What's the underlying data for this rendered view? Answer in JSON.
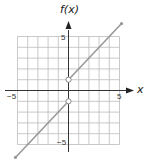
{
  "chart_data": {
    "type": "line",
    "title": "",
    "xlabel": "x",
    "ylabel": "f(x)",
    "xlim": [
      -5,
      5
    ],
    "ylim": [
      -5,
      5
    ],
    "grid": true,
    "grid_step": 1,
    "x_tick_labels": [
      "-5",
      "5"
    ],
    "y_tick_labels": [
      "5",
      "-5"
    ],
    "series": [
      {
        "name": "left piece",
        "equation": "f(x) = x - 1",
        "domain": "x < 0",
        "x": [
          -5.2,
          0
        ],
        "y": [
          -6.2,
          -1
        ],
        "endpoint": {
          "x": 0,
          "y": -1,
          "type": "open"
        }
      },
      {
        "name": "right piece",
        "equation": "f(x) = x + 1",
        "domain": "x > 0",
        "x": [
          0,
          5.2
        ],
        "y": [
          1,
          6.2
        ],
        "endpoint": {
          "x": 0,
          "y": 1,
          "type": "open"
        }
      }
    ],
    "colors": {
      "line": "#999999",
      "grid": "#bbbbbb",
      "axis": "#333333"
    }
  },
  "labels": {
    "y_axis": "f(x)",
    "x_axis": "x",
    "x_min": "−5",
    "x_max": "5",
    "y_max": "5",
    "y_min": "−5"
  }
}
